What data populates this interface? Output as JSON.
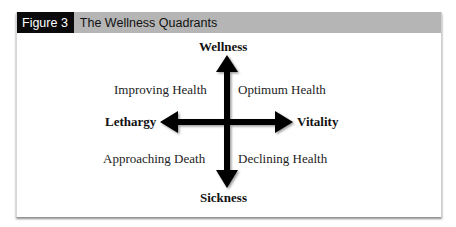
{
  "figure": {
    "number_label": "Figure 3",
    "title": "The Wellness Quadrants"
  },
  "axes": {
    "top": "Wellness",
    "bottom": "Sickness",
    "left": "Lethargy",
    "right": "Vitality"
  },
  "quadrants": {
    "top_left": "Improving Health",
    "top_right": "Optimum Health",
    "bottom_left": "Approaching Death",
    "bottom_right": "Declining Health"
  },
  "colors": {
    "header_bg": "#b5b5b5",
    "label_bg": "#0a0a0a",
    "arrow": "#000000"
  }
}
